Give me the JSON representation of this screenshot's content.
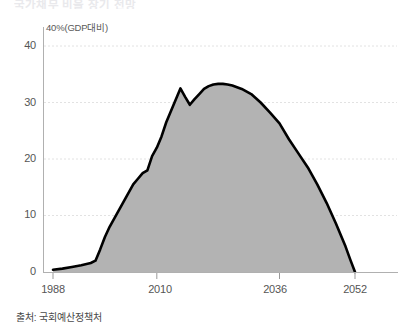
{
  "headline": "국가채무 비율 장기 전망",
  "source_note": "출처: 국회예산정책처",
  "axis_unit_label": "40%(GDP대비)",
  "colors": {
    "area_fill": "#b3b3b3",
    "line": "#000000",
    "axis": "#a8a8a8",
    "gridline": "#e2e2e2",
    "tick_text": "#555555",
    "background": "#ffffff"
  },
  "yticks": [
    "0",
    "10",
    "20",
    "30",
    "40"
  ],
  "xticks": [
    "1988",
    "2010",
    "2036",
    "2052"
  ],
  "chart_data": {
    "type": "area",
    "title": "국가채무 비율 장기 전망",
    "subtitle": "",
    "xlabel": "",
    "ylabel": "40%(GDP대비)",
    "unit": "% (GDP 대비)",
    "source": "출처: 국회예산정책처",
    "grid": true,
    "legend_position": "none",
    "xlim": [
      1988,
      2052
    ],
    "ylim": [
      0,
      40
    ],
    "ytick_values": [
      0,
      10,
      20,
      30,
      40
    ],
    "xtick_values": [
      1988,
      2010,
      2036,
      2052
    ],
    "series": [
      {
        "name": "국가채무 (GDP 대비 %)",
        "x": [
          1988,
          1990,
          1992,
          1994,
          1996,
          1997,
          1998,
          1999,
          2000,
          2001,
          2002,
          2003,
          2004,
          2005,
          2006,
          2007,
          2008,
          2009,
          2010,
          2011,
          2012,
          2013,
          2014,
          2015,
          2016,
          2017,
          2018,
          2019,
          2020,
          2021,
          2022,
          2023,
          2024,
          2025,
          2026,
          2028,
          2030,
          2032,
          2034,
          2036,
          2038,
          2040,
          2042,
          2044,
          2046,
          2048,
          2050,
          2051,
          2052
        ],
        "values": [
          0.4,
          0.6,
          0.9,
          1.2,
          1.6,
          2.0,
          4.0,
          6.2,
          8.0,
          9.5,
          11.0,
          12.5,
          14.0,
          15.5,
          16.5,
          17.5,
          18.0,
          20.5,
          22.0,
          24.0,
          26.5,
          28.5,
          30.5,
          32.5,
          31.0,
          29.6,
          30.6,
          31.5,
          32.4,
          32.9,
          33.2,
          33.3,
          33.3,
          33.2,
          33.0,
          32.4,
          31.5,
          30.0,
          28.2,
          26.3,
          23.5,
          21.0,
          18.5,
          15.5,
          12.2,
          8.5,
          4.5,
          2.2,
          0.0
        ]
      }
    ],
    "annotations": [
      {
        "text": "정점 약 33%",
        "x": 2024,
        "y": 33.3,
        "visible": false
      }
    ]
  }
}
